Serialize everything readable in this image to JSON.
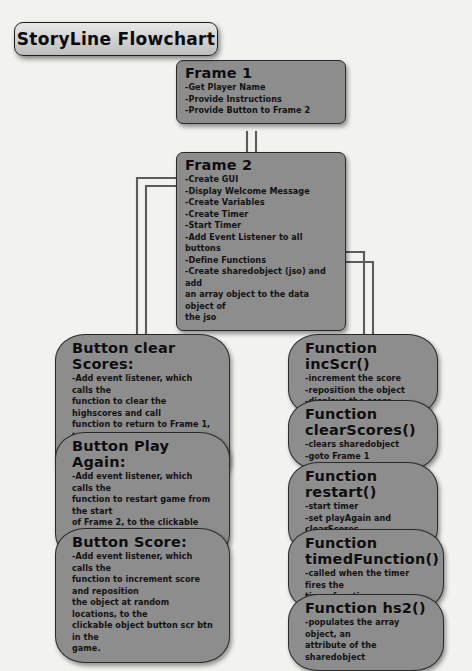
{
  "banner": {
    "title": "StoryLine Flowchart"
  },
  "colors": {
    "background": "#f2f2f0",
    "node_fill": "#8d8d8d",
    "node_border": "#2a2a2a",
    "banner_fill": "#d2d2d2",
    "wire": "#5a5a5a",
    "text": "#101010"
  },
  "nodes": {
    "frame1": {
      "title": "Frame 1",
      "lines": [
        "-Get Player Name",
        "-Provide Instructions",
        "-Provide Button to Frame 2"
      ]
    },
    "frame2": {
      "title": "Frame 2",
      "lines": [
        "-Create GUI",
        "-Display Welcome Message",
        "-Create Variables",
        "-Create Timer",
        "-Start Timer",
        "-Add Event Listener to all buttons",
        "-Define Functions",
        "-Create sharedobject (jso) and add",
        "an array object to the data object of",
        "the jso"
      ]
    },
    "button_clear_scores": {
      "title": "Button clear Scores:",
      "lines": [
        "-Add event listener, which calls the",
        "function to clear the highscores and call",
        "function to return to Frame 1, to the",
        "clickable object button clearScore btn in",
        "the game."
      ]
    },
    "button_play_again": {
      "title": "Button Play Again:",
      "lines": [
        "-Add event listener, which calls the",
        "function to restart game from the start",
        "of Frame 2, to the clickable object button",
        "playAgain btn."
      ]
    },
    "button_score": {
      "title": "Button Score:",
      "lines": [
        "-Add event listener, which calls the",
        "function to increment score and reposition",
        "the object at random locations, to the",
        "clickable object button scr btn in the",
        "game."
      ]
    },
    "function_incscr": {
      "title": "Function incScr()",
      "lines": [
        "-increment the score",
        "-reposition the object",
        "-displays the score"
      ]
    },
    "function_clearscores": {
      "title": "Function clearScores()",
      "lines": [
        "-clears sharedobject",
        "-goto Frame 1"
      ]
    },
    "function_restart": {
      "title": "Function restart()",
      "lines": [
        "-start timer",
        "-set playAgain and clearScores",
        "buttons to false"
      ]
    },
    "function_timedfunction": {
      "title": "Function timedFunction()",
      "lines": [
        "-called when the timer fires the",
        "timer function"
      ]
    },
    "function_hs2": {
      "title": "Function hs2()",
      "lines": [
        "-populates the array object, an",
        "attribute of the sharedobject"
      ]
    }
  }
}
